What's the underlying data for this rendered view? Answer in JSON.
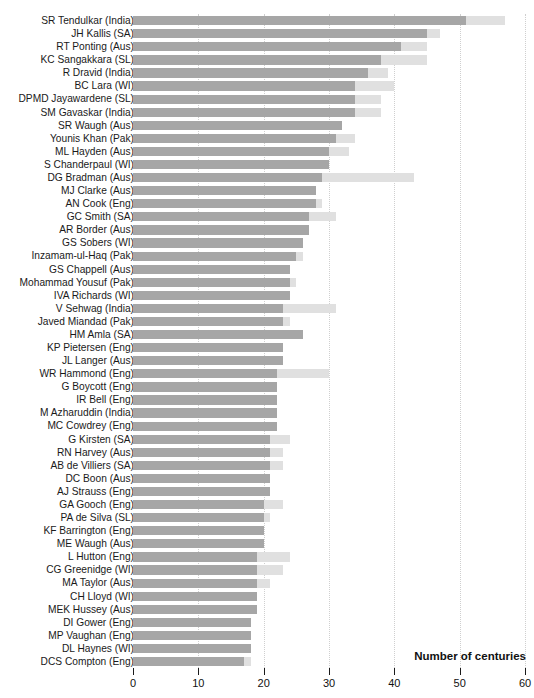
{
  "chart_data": {
    "type": "bar",
    "orientation": "horizontal",
    "stacked": true,
    "title": "",
    "xlabel": "Number of centuries",
    "ylabel": "",
    "xlim": [
      0,
      60
    ],
    "xticks": [
      0,
      10,
      20,
      30,
      40,
      50,
      60
    ],
    "grid": "vertical-dotted",
    "legend_position": "none",
    "colors": {
      "home": "#a6a6a6",
      "away": "#e0e0e0",
      "text": "#111111",
      "grid": "#cfcfcf"
    },
    "series": [
      {
        "name": "home",
        "color": "#a6a6a6"
      },
      {
        "name": "away",
        "color": "#e0e0e0"
      }
    ],
    "categories": [
      "SR Tendulkar (India)",
      "JH Kallis (SA)",
      "RT Ponting (Aus)",
      "KC Sangakkara (SL)",
      "R Dravid (India)",
      "BC Lara (WI)",
      "DPMD Jayawardene (SL)",
      "SM Gavaskar (India)",
      "SR Waugh (Aus)",
      "Younis Khan (Pak)",
      "ML Hayden (Aus)",
      "S Chanderpaul (WI)",
      "DG Bradman (Aus)",
      "MJ Clarke (Aus)",
      "AN Cook (Eng)",
      "GC Smith (SA)",
      "AR Border (Aus)",
      "GS Sobers (WI)",
      "Inzamam-ul-Haq (Pak)",
      "GS Chappell (Aus)",
      "Mohammad Yousuf (Pak)",
      "IVA Richards (WI)",
      "V Sehwag (India)",
      "Javed Miandad (Pak)",
      "HM Amla (SA)",
      "KP Pietersen (Eng)",
      "JL Langer (Aus)",
      "WR Hammond (Eng)",
      "G Boycott (Eng)",
      "IR Bell (Eng)",
      "M Azharuddin (India)",
      "MC Cowdrey (Eng)",
      "G Kirsten (SA)",
      "RN Harvey (Aus)",
      "AB de Villiers (SA)",
      "DC Boon (Aus)",
      "AJ Strauss (Eng)",
      "GA Gooch (Eng)",
      "PA de Silva (SL)",
      "KF Barrington (Eng)",
      "ME Waugh (Aus)",
      "L Hutton (Eng)",
      "CG Greenidge (WI)",
      "MA Taylor (Aus)",
      "CH Lloyd (WI)",
      "MEK Hussey (Aus)",
      "DI Gower (Eng)",
      "MP Vaughan (Eng)",
      "DL Haynes (WI)",
      "DCS Compton (Eng)"
    ],
    "values_home": [
      51,
      45,
      41,
      38,
      36,
      34,
      34,
      34,
      32,
      31,
      30,
      30,
      29,
      28,
      28,
      27,
      27,
      26,
      25,
      24,
      24,
      24,
      23,
      23,
      26,
      23,
      23,
      22,
      22,
      22,
      22,
      22,
      21,
      21,
      21,
      21,
      21,
      20,
      20,
      20,
      20,
      19,
      19,
      19,
      19,
      19,
      18,
      18,
      18,
      17
    ],
    "values_away": [
      6,
      2,
      4,
      7,
      3,
      6,
      4,
      4,
      0,
      3,
      3,
      0,
      14,
      0,
      1,
      4,
      0,
      0,
      1,
      0,
      1,
      0,
      8,
      1,
      0,
      0,
      0,
      8,
      0,
      0,
      0,
      0,
      3,
      2,
      2,
      0,
      0,
      3,
      1,
      0,
      0,
      5,
      4,
      2,
      0,
      0,
      0,
      0,
      0,
      1
    ]
  },
  "axis_title": "Number of centuries",
  "tick_labels": [
    "0",
    "10",
    "20",
    "30",
    "40",
    "50",
    "60"
  ]
}
